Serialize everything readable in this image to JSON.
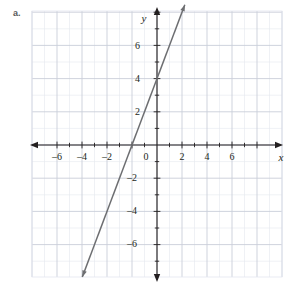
{
  "figure": {
    "part_label": "a.",
    "axis_x_name": "x",
    "axis_y_name": "y"
  },
  "colors": {
    "minor_grid": "#e4e7ef",
    "major_grid": "#c9ced9",
    "axis": "#231f20",
    "line": "#6d6e71",
    "label": "#231f20",
    "part_label": "#58595b",
    "background": "#ffffff"
  },
  "chart_data": {
    "type": "line",
    "title": "",
    "xlabel": "x",
    "ylabel": "y",
    "xlim": [
      -8,
      8
    ],
    "ylim": [
      -8,
      8
    ],
    "grid": true,
    "grid_minor_step": 1,
    "grid_major_step": 2,
    "legend": "none",
    "xticks": [
      -6,
      -4,
      -2,
      0,
      2,
      4,
      6
    ],
    "xticklabels": [
      "–6",
      "–4",
      "–2",
      "0",
      "2",
      "4",
      "6"
    ],
    "yticks": [
      -6,
      -4,
      -2,
      2,
      4,
      6
    ],
    "yticklabels": [
      "–6",
      "–4",
      "–2",
      "2",
      "4",
      "6"
    ],
    "origin_label": "0",
    "series": [
      {
        "name": "y = 2x + 4",
        "equation": "y = 2x + 4",
        "slope": 2,
        "intercept": 4,
        "x_intercept": -2,
        "y_intercept": 4,
        "arrows": "both",
        "x": [
          -7.5,
          2.2
        ],
        "y": [
          -11,
          8.4
        ],
        "points": [
          {
            "x": -2,
            "y": 0
          },
          {
            "x": 0,
            "y": 4
          },
          {
            "x": 2,
            "y": 8
          }
        ]
      }
    ]
  },
  "ticks": {
    "x": [
      {
        "label": "–6",
        "px": 57,
        "py": 160
      },
      {
        "label": "–4",
        "px": 82,
        "py": 160
      },
      {
        "label": "–2",
        "px": 107,
        "py": 160
      },
      {
        "label": "2",
        "px": 182,
        "py": 160
      },
      {
        "label": "4",
        "px": 207,
        "py": 160
      },
      {
        "label": "6",
        "px": 232,
        "py": 160
      }
    ],
    "y": [
      {
        "label": "6",
        "px": 140,
        "py": 49
      },
      {
        "label": "4",
        "px": 140,
        "py": 82
      },
      {
        "label": "2",
        "px": 140,
        "py": 115
      },
      {
        "label": "–2",
        "px": 137,
        "py": 181
      },
      {
        "label": "–4",
        "px": 137,
        "py": 214
      },
      {
        "label": "–6",
        "px": 137,
        "py": 247
      }
    ],
    "origin": {
      "label": "0",
      "px": 146,
      "py": 160
    }
  }
}
